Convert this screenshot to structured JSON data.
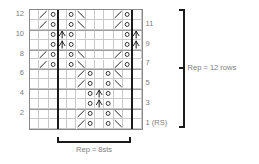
{
  "chart": {
    "columns": 12,
    "rows": 12,
    "repeat_col_start": 4,
    "repeat_col_end": 12,
    "row_labels_left": [
      "12",
      "10",
      "8",
      "6",
      "4",
      "2"
    ],
    "row_labels_right": [
      "11",
      "9",
      "7",
      "5",
      "3",
      "1 (RS)"
    ]
  },
  "brackets": {
    "bottom": {
      "label": "Rep = 8sts"
    },
    "right": {
      "label": "Rep = 12 rows"
    }
  },
  "symbols": {
    "yo": "yarn-over-circle",
    "k2tog": "right-leaning-decrease-slash",
    "ssk": "left-leaning-decrease-backslash",
    "cdd": "central-double-decrease-peak",
    "blank": "knit-blank"
  },
  "cells": [
    {
      "row": 12,
      "col": 2,
      "sym": "k2tog"
    },
    {
      "row": 12,
      "col": 3,
      "sym": "yo"
    },
    {
      "row": 12,
      "col": 5,
      "sym": "yo"
    },
    {
      "row": 12,
      "col": 6,
      "sym": "ssk"
    },
    {
      "row": 12,
      "col": 10,
      "sym": "k2tog"
    },
    {
      "row": 12,
      "col": 11,
      "sym": "yo"
    },
    {
      "row": 11,
      "col": 2,
      "sym": "k2tog"
    },
    {
      "row": 11,
      "col": 3,
      "sym": "yo"
    },
    {
      "row": 11,
      "col": 5,
      "sym": "yo"
    },
    {
      "row": 11,
      "col": 6,
      "sym": "ssk"
    },
    {
      "row": 11,
      "col": 10,
      "sym": "k2tog"
    },
    {
      "row": 11,
      "col": 11,
      "sym": "yo"
    },
    {
      "row": 10,
      "col": 3,
      "sym": "yo"
    },
    {
      "row": 10,
      "col": 4,
      "sym": "cdd"
    },
    {
      "row": 10,
      "col": 5,
      "sym": "yo"
    },
    {
      "row": 10,
      "col": 11,
      "sym": "yo"
    },
    {
      "row": 10,
      "col": 12,
      "sym": "cdd"
    },
    {
      "row": 9,
      "col": 3,
      "sym": "yo"
    },
    {
      "row": 9,
      "col": 4,
      "sym": "cdd"
    },
    {
      "row": 9,
      "col": 5,
      "sym": "yo"
    },
    {
      "row": 9,
      "col": 11,
      "sym": "yo"
    },
    {
      "row": 9,
      "col": 12,
      "sym": "cdd"
    },
    {
      "row": 8,
      "col": 2,
      "sym": "k2tog"
    },
    {
      "row": 8,
      "col": 3,
      "sym": "yo"
    },
    {
      "row": 8,
      "col": 5,
      "sym": "yo"
    },
    {
      "row": 8,
      "col": 6,
      "sym": "ssk"
    },
    {
      "row": 8,
      "col": 10,
      "sym": "k2tog"
    },
    {
      "row": 8,
      "col": 11,
      "sym": "yo"
    },
    {
      "row": 7,
      "col": 2,
      "sym": "k2tog"
    },
    {
      "row": 7,
      "col": 3,
      "sym": "yo"
    },
    {
      "row": 7,
      "col": 5,
      "sym": "yo"
    },
    {
      "row": 7,
      "col": 6,
      "sym": "ssk"
    },
    {
      "row": 7,
      "col": 10,
      "sym": "k2tog"
    },
    {
      "row": 7,
      "col": 11,
      "sym": "yo"
    },
    {
      "row": 6,
      "col": 6,
      "sym": "k2tog"
    },
    {
      "row": 6,
      "col": 7,
      "sym": "yo"
    },
    {
      "row": 6,
      "col": 9,
      "sym": "yo"
    },
    {
      "row": 6,
      "col": 10,
      "sym": "ssk"
    },
    {
      "row": 5,
      "col": 6,
      "sym": "k2tog"
    },
    {
      "row": 5,
      "col": 7,
      "sym": "yo"
    },
    {
      "row": 5,
      "col": 9,
      "sym": "yo"
    },
    {
      "row": 5,
      "col": 10,
      "sym": "ssk"
    },
    {
      "row": 4,
      "col": 7,
      "sym": "yo"
    },
    {
      "row": 4,
      "col": 8,
      "sym": "cdd"
    },
    {
      "row": 4,
      "col": 9,
      "sym": "yo"
    },
    {
      "row": 3,
      "col": 7,
      "sym": "yo"
    },
    {
      "row": 3,
      "col": 8,
      "sym": "cdd"
    },
    {
      "row": 3,
      "col": 9,
      "sym": "yo"
    },
    {
      "row": 2,
      "col": 6,
      "sym": "k2tog"
    },
    {
      "row": 2,
      "col": 7,
      "sym": "yo"
    },
    {
      "row": 2,
      "col": 9,
      "sym": "yo"
    },
    {
      "row": 2,
      "col": 10,
      "sym": "ssk"
    },
    {
      "row": 1,
      "col": 6,
      "sym": "k2tog"
    },
    {
      "row": 1,
      "col": 7,
      "sym": "yo"
    },
    {
      "row": 1,
      "col": 9,
      "sym": "yo"
    },
    {
      "row": 1,
      "col": 10,
      "sym": "ssk"
    }
  ],
  "colors": {
    "grid_line": "#c9c9c9",
    "grid_border": "#8a8a8a",
    "repeat_line": "#1a1a1a",
    "symbol": "#1a1a1a",
    "label_text": "#7d7d7d",
    "shade": "#f0f0f0",
    "background": "#ffffff"
  }
}
